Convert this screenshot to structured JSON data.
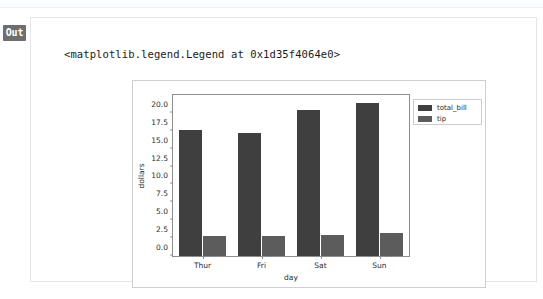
{
  "cell": {
    "prompt_label": "Out",
    "repr_text": "<matplotlib.legend.Legend at 0x1d35f4064e0>"
  },
  "chart_data": {
    "type": "bar",
    "title": "",
    "xlabel": "day",
    "ylabel": "dollars",
    "categories": [
      "Thur",
      "Fri",
      "Sat",
      "Sun"
    ],
    "series": [
      {
        "name": "total_bill",
        "color": "#3f3f3f",
        "values": [
          17.68,
          17.15,
          20.44,
          21.41
        ]
      },
      {
        "name": "tip",
        "color": "#5c5c5c",
        "values": [
          2.77,
          2.73,
          2.99,
          3.26
        ]
      }
    ],
    "ylim": [
      0.0,
      22.5
    ],
    "yticks": [
      "0.0",
      "2.5",
      "5.0",
      "7.5",
      "10.0",
      "12.5",
      "15.0",
      "17.5",
      "20.0"
    ],
    "ytick_values": [
      0.0,
      2.5,
      5.0,
      7.5,
      10.0,
      12.5,
      15.0,
      17.5,
      20.0
    ],
    "grid": false,
    "legend_position": "upper right outside",
    "legend_entries": [
      "total_bill",
      "tip"
    ]
  }
}
